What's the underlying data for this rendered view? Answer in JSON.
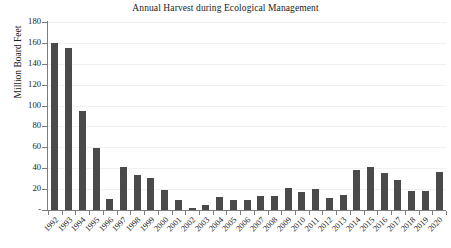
{
  "chart_data": {
    "type": "bar",
    "title": "Annual Harvest during Ecological Management",
    "xlabel": "",
    "ylabel": "Million Board Feet",
    "ylim": [
      0,
      180
    ],
    "yticks": [
      0,
      20,
      40,
      60,
      80,
      100,
      120,
      140,
      160,
      180
    ],
    "ytick_labels": [
      "-",
      "20",
      "40",
      "60",
      "80",
      "100",
      "120",
      "140",
      "160",
      "180"
    ],
    "grid": true,
    "grid_axis": "y",
    "legend": false,
    "legend_position": "none",
    "bar_color": "#4a4a4a",
    "categories": [
      "1992",
      "1993",
      "1994",
      "1995",
      "1996",
      "1997",
      "1998",
      "1999",
      "2000",
      "2001",
      "2002",
      "2003",
      "2004",
      "2005",
      "2006",
      "2007",
      "2008",
      "2009",
      "2010",
      "2011",
      "2012",
      "2013",
      "2014",
      "2015",
      "2016",
      "2017",
      "2018",
      "2019",
      "2020"
    ],
    "values": [
      160,
      155,
      95,
      59,
      11,
      41,
      34,
      31,
      19.5,
      9.5,
      1.5,
      4.5,
      12,
      10,
      9.5,
      13,
      13.5,
      21,
      17.5,
      20.5,
      11.5,
      14.5,
      38.5,
      41,
      35.5,
      29,
      18,
      18.5,
      36
    ]
  },
  "colors": {
    "bar": "#4a4a4a",
    "axis": "#7d7d7d",
    "grid": "#f0f0f0",
    "text": "#1c1c1c",
    "background": "#ffffff"
  }
}
